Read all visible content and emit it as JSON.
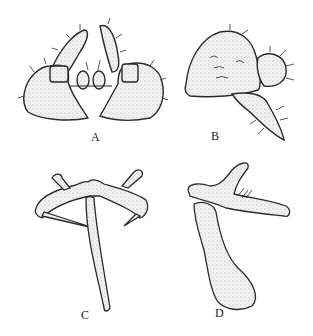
{
  "figure": {
    "panels": [
      {
        "id": "A",
        "label": "A",
        "description": "ventral view of genital plates with paired dorsal processes and central lobes"
      },
      {
        "id": "B",
        "label": "B",
        "description": "lateral view of plate with setose lobe and spine-like process"
      },
      {
        "id": "C",
        "label": "C",
        "description": "sclerite frame with elongate median rod"
      },
      {
        "id": "D",
        "label": "D",
        "description": "lateral view of sclerite with clavate median rod"
      }
    ],
    "colors": {
      "background": "#ffffff",
      "ink": "#2a2a2a",
      "stipple": "#e6e6e6"
    }
  }
}
